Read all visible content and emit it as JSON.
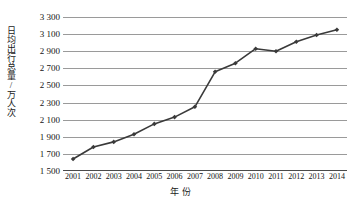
{
  "chart_data": {
    "type": "line",
    "title": "",
    "xlabel": "年  份",
    "ylabel": "日均出行总量/万人次",
    "categories": [
      "2001",
      "2002",
      "2003",
      "2004",
      "2005",
      "2006",
      "2007",
      "2008",
      "2009",
      "2010",
      "2011",
      "2012",
      "2013",
      "2014"
    ],
    "values": [
      1640,
      1780,
      1840,
      1930,
      2050,
      2130,
      2250,
      2660,
      2760,
      2930,
      2900,
      3010,
      3090,
      3150
    ],
    "series": [
      {
        "name": "日均出行总量",
        "values": [
          1640,
          1780,
          1840,
          1930,
          2050,
          2130,
          2250,
          2660,
          2760,
          2930,
          2900,
          3010,
          3090,
          3150
        ]
      }
    ],
    "ylim": [
      1500,
      3300
    ],
    "ytick_step": 200,
    "ytick_labels": [
      "3 300",
      "3 100",
      "2 900",
      "2 700",
      "2 500",
      "2 300",
      "2 100",
      "1 900",
      "1 700",
      "1 500"
    ],
    "ytick_values": [
      3300,
      3100,
      2900,
      2700,
      2500,
      2300,
      2100,
      1900,
      1700,
      1500
    ],
    "grid": true,
    "legend": "none",
    "marker": "diamond",
    "line_color": "#3a3a3a",
    "grid_color": "#9a9a9a"
  }
}
